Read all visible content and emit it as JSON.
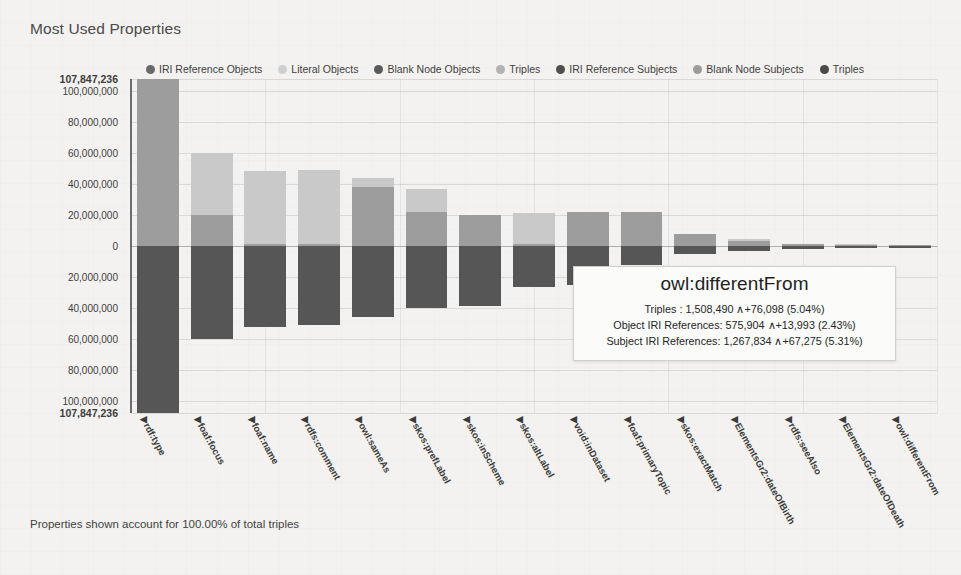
{
  "chart": {
    "title": "Most Used Properties",
    "footnote": "Properties shown account for 100.00% of total triples"
  },
  "legend": [
    {
      "label": "IRI Reference Objects",
      "color": "#6a6a6a"
    },
    {
      "label": "Literal Objects",
      "color": "#cfcfcf"
    },
    {
      "label": "Blank Node Objects",
      "color": "#5a5a5a"
    },
    {
      "label": "Triples",
      "color": "#b2b2b2"
    },
    {
      "label": "IRI Reference Subjects",
      "color": "#4f4f4f"
    },
    {
      "label": "Blank Node Subjects",
      "color": "#9b9b9b"
    },
    {
      "label": "Triples",
      "color": "#4a4a4a"
    }
  ],
  "tooltip": {
    "title": "owl:differentFrom",
    "rows": [
      "Triples : 1,508,490 ∧+76,098 (5.04%)",
      "Object IRI References: 575,904 ∧+13,993 (2.43%)",
      "Subject IRI References: 1,267,834 ∧+67,275 (5.31%)"
    ]
  },
  "chart_data": {
    "type": "bar",
    "title": "Most Used Properties",
    "xlabel": "",
    "ylabel": "",
    "ylim": [
      -107847236,
      107847236
    ],
    "grid": true,
    "legend_position": "top",
    "axis_note": "Diverging stacked bars: object-side counts plotted above zero, subject-side counts plotted below zero.",
    "y_ticks": [
      {
        "value": 107847236,
        "label": "107,847,236",
        "bold": true
      },
      {
        "value": 100000000,
        "label": "100,000,000",
        "bold": false
      },
      {
        "value": 80000000,
        "label": "80,000,000",
        "bold": false
      },
      {
        "value": 60000000,
        "label": "60,000,000",
        "bold": false
      },
      {
        "value": 40000000,
        "label": "40,000,000",
        "bold": false
      },
      {
        "value": 20000000,
        "label": "20,000,000",
        "bold": false
      },
      {
        "value": 0,
        "label": "0",
        "bold": false
      },
      {
        "value": -20000000,
        "label": "20,000,000",
        "bold": false
      },
      {
        "value": -40000000,
        "label": "40,000,000",
        "bold": false
      },
      {
        "value": -60000000,
        "label": "60,000,000",
        "bold": false
      },
      {
        "value": -80000000,
        "label": "80,000,000",
        "bold": false
      },
      {
        "value": -100000000,
        "label": "100,000,000",
        "bold": false
      },
      {
        "value": -107847236,
        "label": "107,847,236",
        "bold": true
      }
    ],
    "categories": [
      "rdf:type",
      "foaf:focus",
      "foaf:name",
      "rdfs:comment",
      "owl:sameAs",
      "skos:prefLabel",
      "skos:inScheme",
      "skos:altLabel",
      "void:inDataset",
      "foaf:primaryTopic",
      "skos:exactMatch",
      "ElementsGr2:dateOfBirth",
      "rdfs:seeAlso",
      "ElementsGr2:dateOfDeath",
      "owl:differentFrom"
    ],
    "series": [
      {
        "name": "IRI Reference Objects",
        "side": "above",
        "color": "#9d9d9d",
        "values": [
          107847236,
          20000000,
          1500000,
          1000000,
          38000000,
          22000000,
          20000000,
          1000000,
          22000000,
          22000000,
          8000000,
          3000000,
          1500000,
          700000,
          575904
        ]
      },
      {
        "name": "Literal Objects",
        "side": "above",
        "color": "#c9c9c9",
        "values": [
          0,
          40000000,
          47000000,
          48000000,
          6000000,
          15000000,
          0,
          20500000,
          0,
          0,
          0,
          1400000,
          0,
          600000,
          0
        ]
      },
      {
        "name": "IRI Reference Subjects",
        "side": "below",
        "color": "#565656",
        "values": [
          107847236,
          60000000,
          52000000,
          51000000,
          46000000,
          40000000,
          38500000,
          26500000,
          25000000,
          12000000,
          5000000,
          3000000,
          2000000,
          1300000,
          1267834
        ]
      }
    ]
  }
}
